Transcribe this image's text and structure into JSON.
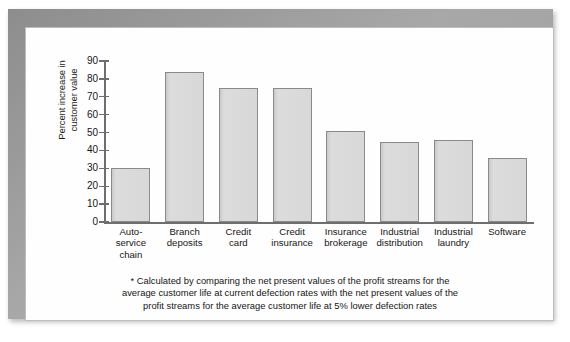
{
  "chart_data": {
    "type": "bar",
    "title": "",
    "xlabel": "",
    "ylabel": "Percent increase in\ncustomer value",
    "ylim": [
      0,
      90
    ],
    "grid": false,
    "legend": "none",
    "ytick_labels": [
      "90",
      "80",
      "70",
      "60",
      "50",
      "40",
      "30",
      "20",
      "10",
      "0"
    ],
    "yticks": [
      90,
      80,
      70,
      60,
      50,
      40,
      30,
      20,
      10,
      0
    ],
    "categories": [
      "Auto-\nservice\nchain",
      "Branch\ndeposits",
      "Credit\ncard",
      "Credit\ninsurance",
      "Insurance\nbrokerage",
      "Industrial\ndistribution",
      "Industrial\nlaundry",
      "Software"
    ],
    "values": [
      30,
      84,
      75,
      75,
      51,
      45,
      46,
      36
    ],
    "bar_fill_color": "#d6d6d6",
    "bar_edge_color": "#8a8a8a",
    "axis_color": "#6e6e6e",
    "background_color": "#fefefe"
  },
  "footnote": {
    "line1": "* Calculated by comparing the net present values of the profit streams for the",
    "line2": "average customer life at current defection rates with the net present values of the",
    "line3": "profit streams for the average customer life at 5% lower defection rates"
  }
}
